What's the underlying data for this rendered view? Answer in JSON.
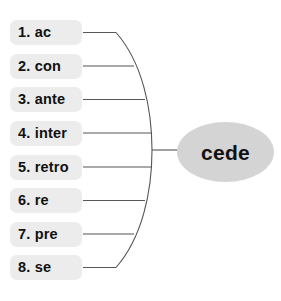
{
  "diagram": {
    "type": "word-web",
    "root": {
      "label": "cede",
      "shape": "ellipse",
      "fill_color": "#d4d4d4",
      "text_color": "#111111"
    },
    "branch_style": {
      "line_color": "#555555",
      "brace": "curved-vertical-arc"
    },
    "chip_style": {
      "fill_color": "#ececec",
      "text_color": "#111111"
    },
    "items": [
      {
        "number": "1.",
        "prefix": "ac",
        "label": "1. ac"
      },
      {
        "number": "2.",
        "prefix": "con",
        "label": "2. con"
      },
      {
        "number": "3.",
        "prefix": "ante",
        "label": "3. ante"
      },
      {
        "number": "4.",
        "prefix": "inter",
        "label": "4. inter"
      },
      {
        "number": "5.",
        "prefix": "retro",
        "label": "5. retro"
      },
      {
        "number": "6.",
        "prefix": "re",
        "label": "6. re"
      },
      {
        "number": "7.",
        "prefix": "pre",
        "label": "7. pre"
      },
      {
        "number": "8.",
        "prefix": "se",
        "label": "8. se"
      }
    ]
  }
}
